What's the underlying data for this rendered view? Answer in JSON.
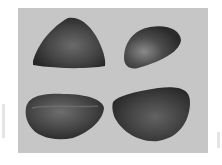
{
  "image": {
    "description": "Grayscale photograph of four dark, rounded stone-like seeds on a light gray background",
    "subject_count": 4,
    "colors": {
      "background": "#c6c6c6",
      "page": "#ffffff",
      "object_dark": "#2e2e2e",
      "object_mid": "#555555",
      "object_highlight": "#8a8a8a"
    },
    "objects": [
      {
        "label": "top-left seed"
      },
      {
        "label": "top-right seed"
      },
      {
        "label": "bottom-left seed"
      },
      {
        "label": "bottom-right seed"
      }
    ]
  }
}
